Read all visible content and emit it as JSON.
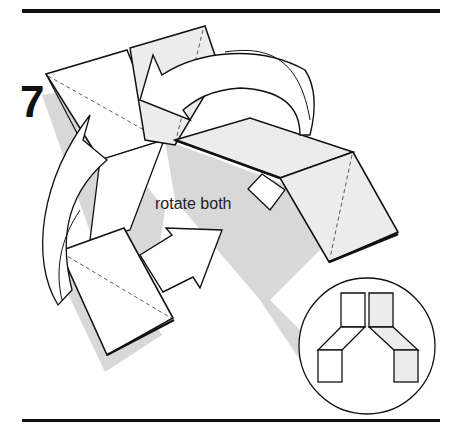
{
  "step": {
    "number": "7"
  },
  "instruction": {
    "text": "rotate both"
  },
  "colors": {
    "line": "#111111",
    "shade": "#d6d6d6",
    "paper": "#ffffff",
    "colored_side": "#ececec"
  },
  "inset": {
    "description": "result view: two units joined in an inverted-V shape"
  }
}
